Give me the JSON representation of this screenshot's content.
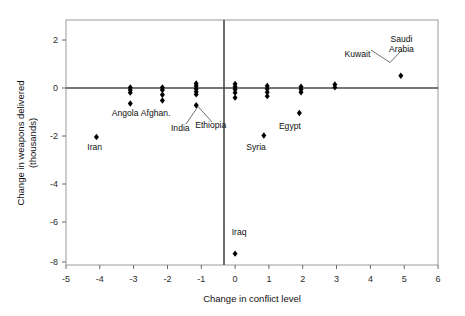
{
  "chart_data": {
    "type": "scatter",
    "title": "",
    "xlabel": "Change in conflict level",
    "ylabel": "Change in weapons delivered (thousands)",
    "ylabel_line1": "Change in weapons delivered",
    "ylabel_line2": "(thousands)",
    "xlim": [
      -5,
      6
    ],
    "ylim": [
      -8,
      3.2
    ],
    "xticks": [
      "-5",
      "-4",
      "-3",
      "-2",
      "-1",
      "0",
      "1",
      "2",
      "3",
      "4",
      "5",
      "6"
    ],
    "xtick_values": [
      -5,
      -4,
      -3,
      -2,
      -1,
      0,
      1,
      2,
      3,
      4,
      5,
      6
    ],
    "yticks": [
      "2",
      "0",
      "-2",
      "-4",
      "-6",
      "-8"
    ],
    "ytick_values": [
      2,
      0,
      -2,
      -4,
      -6,
      -8
    ],
    "grid": false,
    "legend": "none",
    "marker_shape": "diamond",
    "marker_color": "#000000",
    "zero_lines": {
      "x": 0,
      "y": 0
    },
    "points": [
      {
        "x": -4.1,
        "y": -2.15,
        "label": "Iran"
      },
      {
        "x": -3.1,
        "y": 0.12
      },
      {
        "x": -3.1,
        "y": 0.0
      },
      {
        "x": -3.1,
        "y": -0.12
      },
      {
        "x": -3.1,
        "y": -0.62,
        "label": "Angola"
      },
      {
        "x": -2.15,
        "y": 0.12
      },
      {
        "x": -2.15,
        "y": 0.0
      },
      {
        "x": -2.15,
        "y": -0.22
      },
      {
        "x": -2.15,
        "y": -0.48,
        "label": "Afghan."
      },
      {
        "x": -1.15,
        "y": 0.3
      },
      {
        "x": -1.15,
        "y": 0.18
      },
      {
        "x": -1.15,
        "y": 0.05
      },
      {
        "x": -1.15,
        "y": -0.08
      },
      {
        "x": -1.15,
        "y": -0.2
      },
      {
        "x": -1.15,
        "y": -0.7,
        "label": "India / Ethiopia"
      },
      {
        "x": 0.0,
        "y": 0.28
      },
      {
        "x": 0.0,
        "y": 0.15
      },
      {
        "x": 0.0,
        "y": 0.02
      },
      {
        "x": 0.0,
        "y": -0.12
      },
      {
        "x": 0.0,
        "y": -0.35
      },
      {
        "x": 0.0,
        "y": -7.48,
        "label": "Iraq"
      },
      {
        "x": 0.95,
        "y": 0.18
      },
      {
        "x": 0.95,
        "y": 0.05
      },
      {
        "x": 0.95,
        "y": -0.1
      },
      {
        "x": 0.95,
        "y": -0.28
      },
      {
        "x": 0.85,
        "y": -2.08,
        "label": "Syria"
      },
      {
        "x": 1.95,
        "y": 0.15
      },
      {
        "x": 1.95,
        "y": 0.02
      },
      {
        "x": 1.95,
        "y": -0.1
      },
      {
        "x": 1.9,
        "y": -1.05,
        "label": "Egypt"
      },
      {
        "x": 2.95,
        "y": 0.25
      },
      {
        "x": 2.95,
        "y": 0.12
      },
      {
        "x": 4.9,
        "y": 0.65,
        "label": "Kuwait / Saudi Arabia"
      }
    ],
    "annotations": [
      {
        "text": "Iran",
        "x": -4.15,
        "y": -2.75
      },
      {
        "text": "Angola",
        "x": -3.25,
        "y": -1.18
      },
      {
        "text": "Afghan.",
        "x": -2.35,
        "y": -1.18
      },
      {
        "text": "India",
        "x": -1.62,
        "y": -1.88
      },
      {
        "text": "Ethiopia",
        "x": -0.72,
        "y": -1.72
      },
      {
        "text": "Iraq",
        "x": 0.12,
        "y": -6.62
      },
      {
        "text": "Syria",
        "x": 0.62,
        "y": -2.72
      },
      {
        "text": "Egypt",
        "x": 1.62,
        "y": -1.78
      },
      {
        "text": "Kuwait",
        "x": 3.62,
        "y": 1.52
      },
      {
        "text": "Saudi",
        "x": 4.92,
        "y": 2.18
      },
      {
        "text": "Arabia",
        "x": 4.92,
        "y": 1.72
      }
    ]
  }
}
